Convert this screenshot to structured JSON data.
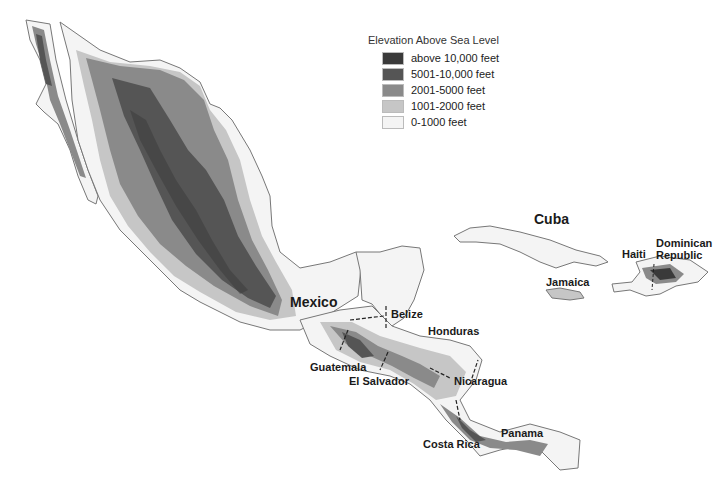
{
  "map": {
    "type": "elevation relief map",
    "region": "Mexico, Central America and Greater Antilles"
  },
  "legend": {
    "title": "Elevation Above Sea Level",
    "items": [
      {
        "label": "above 10,000 feet",
        "color": "#3a3a3a"
      },
      {
        "label": "5001-10,000 feet",
        "color": "#555555"
      },
      {
        "label": "2001-5000 feet",
        "color": "#8a8a8a"
      },
      {
        "label": "1001-2000 feet",
        "color": "#c6c6c6"
      },
      {
        "label": "0-1000 feet",
        "color": "#f4f4f4"
      }
    ]
  },
  "labels": {
    "mexico": "Mexico",
    "cuba": "Cuba",
    "haiti": "Haiti",
    "dominican_republic_1": "Dominican",
    "dominican_republic_2": "Republic",
    "jamaica": "Jamaica",
    "belize": "Belize",
    "honduras": "Honduras",
    "guatemala": "Guatemala",
    "el_salvador": "El Salvador",
    "nicaragua": "Nicaragua",
    "costa_rica": "Costa Rica",
    "panama": "Panama"
  }
}
